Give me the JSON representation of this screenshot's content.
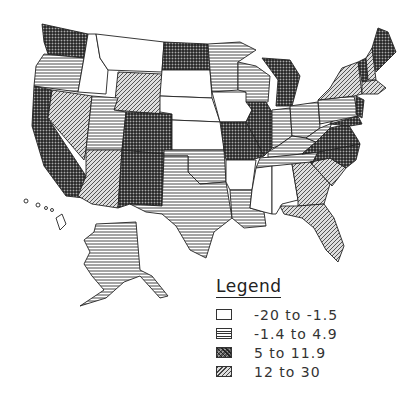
{
  "map": {
    "type": "choropleth",
    "region": "United States",
    "patterns": {
      "blank": "white",
      "horizontal": "horizontal-lines",
      "crosshatch": "dense-crosshatch",
      "diagonal": "diagonal-lines"
    },
    "states": {
      "WA": "crosshatch",
      "OR": "horizontal",
      "CA": "crosshatch",
      "ID": "blank",
      "NV": "diagonal",
      "MT": "blank",
      "WY": "diagonal",
      "UT": "horizontal",
      "AZ": "diagonal",
      "CO": "crosshatch",
      "NM": "crosshatch",
      "ND": "crosshatch",
      "SD": "blank",
      "NE": "blank",
      "KS": "blank",
      "OK": "horizontal",
      "TX": "horizontal",
      "MN": "horizontal",
      "IA": "blank",
      "MO": "crosshatch",
      "AR": "blank",
      "LA": "horizontal",
      "WI": "horizontal",
      "IL": "crosshatch",
      "MI": "crosshatch",
      "IN": "horizontal",
      "OH": "horizontal",
      "KY": "horizontal",
      "TN": "horizontal",
      "MS": "blank",
      "AL": "blank",
      "GA": "diagonal",
      "FL": "diagonal",
      "SC": "diagonal",
      "NC": "crosshatch",
      "VA": "crosshatch",
      "WV": "horizontal",
      "PA": "horizontal",
      "NY": "diagonal",
      "VT": "crosshatch",
      "NH": "diagonal",
      "ME": "crosshatch",
      "MA": "diagonal",
      "NJ": "crosshatch",
      "MD": "crosshatch",
      "AK": "horizontal",
      "HI": "blank"
    }
  },
  "legend": {
    "title": "Legend",
    "items": [
      {
        "label": "-20  to  -1.5",
        "pattern": "blank"
      },
      {
        "label": "-1.4  to  4.9",
        "pattern": "horizontal"
      },
      {
        "label": "5  to  11.9",
        "pattern": "crosshatch"
      },
      {
        "label": "12  to  30",
        "pattern": "diagonal"
      }
    ]
  }
}
